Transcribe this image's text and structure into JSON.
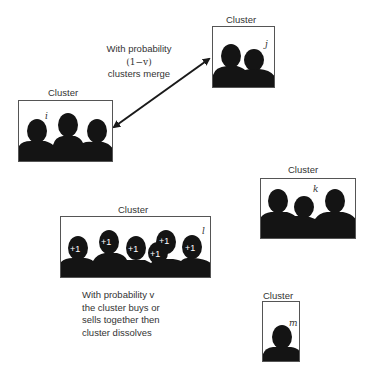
{
  "diagram": {
    "type": "cluster-dynamics",
    "clusters": [
      {
        "id": "i",
        "label": "Cluster",
        "variable": "i",
        "members": 3,
        "tokens": []
      },
      {
        "id": "j",
        "label": "Cluster",
        "variable": "j",
        "members": 2,
        "tokens": []
      },
      {
        "id": "k",
        "label": "Cluster",
        "variable": "k",
        "members": 3,
        "tokens": []
      },
      {
        "id": "l",
        "label": "Cluster",
        "variable": "l",
        "members": 6,
        "tokens": [
          "+1",
          "+1",
          "+1",
          "+1",
          "+1",
          "+1"
        ]
      },
      {
        "id": "m",
        "label": "Cluster",
        "variable": "m",
        "members": 1,
        "tokens": []
      }
    ],
    "edges": [
      {
        "from": "i",
        "to": "j",
        "type": "bidirectional-arrow"
      }
    ],
    "notes": {
      "merge": {
        "line1": "With probability",
        "line2": "(1−v)",
        "line3": "clusters merge"
      },
      "dissolve": {
        "line1": "With probability v",
        "line2": "the cluster buys or",
        "line3": "sells together then",
        "line4": "cluster dissolves"
      }
    },
    "colors": {
      "silhouette": "#141414",
      "border": "#555555",
      "text": "#333333",
      "token_text": "#ffffff"
    }
  }
}
